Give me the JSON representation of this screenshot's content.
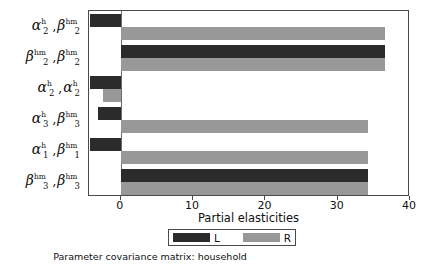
{
  "caption": "Parameter covariance matrix: household",
  "legend": {
    "entries": [
      {
        "key": "L",
        "label": "L",
        "color": "#2b2b2b"
      },
      {
        "key": "R",
        "label": "R",
        "color": "#989898"
      }
    ]
  },
  "axis": {
    "xlabel": "Partial elasticities",
    "ticks": [
      "0",
      "10",
      "20",
      "30",
      "40"
    ]
  },
  "category_labels": [
    {
      "left": {
        "base": "α",
        "sup": "h",
        "sub": "2"
      },
      "right": {
        "base": "β",
        "sup": "hm",
        "sub": "2"
      }
    },
    {
      "left": {
        "base": "β",
        "sup": "hm",
        "sub": "2"
      },
      "right": {
        "base": "β",
        "sup": "hm",
        "sub": "2"
      }
    },
    {
      "left": {
        "base": "α",
        "sup": "h",
        "sub": "2"
      },
      "right": {
        "base": "α",
        "sup": "h",
        "sub": "2"
      }
    },
    {
      "left": {
        "base": "α",
        "sup": "h",
        "sub": "3"
      },
      "right": {
        "base": "β",
        "sup": "hm",
        "sub": "3"
      }
    },
    {
      "left": {
        "base": "α",
        "sup": "h",
        "sub": "1"
      },
      "right": {
        "base": "β",
        "sup": "hm",
        "sub": "1"
      }
    },
    {
      "left": {
        "base": "β",
        "sup": "hm",
        "sub": "3"
      },
      "right": {
        "base": "β",
        "sup": "hm",
        "sub": "3"
      }
    }
  ],
  "chart_data": {
    "type": "bar",
    "orientation": "horizontal",
    "title": "",
    "subtitle": "Parameter covariance matrix: household",
    "xlabel": "Partial elasticities",
    "ylabel": "",
    "xlim": [
      -4.4,
      40
    ],
    "xticks": [
      0,
      10,
      20,
      30,
      40
    ],
    "grid": false,
    "legend_position": "bottom",
    "categories": [
      "alpha^h_2 , beta^hm_2",
      "beta^hm_2 , beta^hm_2",
      "alpha^h_2 , alpha^h_2",
      "alpha^h_3 , beta^hm_3",
      "alpha^h_1 , beta^hm_1",
      "beta^hm_3 , beta^hm_3"
    ],
    "series": [
      {
        "name": "L",
        "color": "#2b2b2b",
        "values": [
          -4.3,
          36.5,
          -4.3,
          -3.2,
          -4.3,
          34.2
        ]
      },
      {
        "name": "R",
        "color": "#989898",
        "values": [
          36.5,
          36.5,
          -2.5,
          34.2,
          34.2,
          34.2
        ]
      }
    ]
  }
}
